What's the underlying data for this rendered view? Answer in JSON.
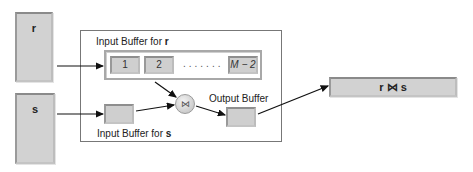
{
  "relations": {
    "r": {
      "label": "r"
    },
    "s": {
      "label": "s"
    }
  },
  "memory": {
    "input_buffer_r_caption": "Input Buffer for ",
    "input_buffer_r_rel": "r",
    "input_buffer_s_caption": "Input Buffer for ",
    "input_buffer_s_rel": "s",
    "output_buffer_caption": "Output Buffer",
    "buffer_blocks": [
      {
        "label": "1"
      },
      {
        "label": "2"
      },
      {
        "label": "M − 2"
      }
    ],
    "ellipsis": ".......",
    "join_symbol": "⋈"
  },
  "result": {
    "label": "r ⋈ s"
  },
  "colors": {
    "block_fill": "#d2d2d2",
    "line": "#111111",
    "container_border": "#777777"
  }
}
